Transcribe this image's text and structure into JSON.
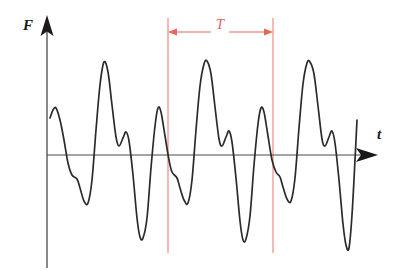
{
  "figure": {
    "background_color": "#ffffff",
    "width": 401,
    "height": 271
  },
  "axes": {
    "vertical": {
      "label": "F",
      "icon": "up-arrow-icon",
      "color": "#333333",
      "x": 47,
      "top_y": 18,
      "bottom_y": 268,
      "label_x": 23,
      "label_y": 30
    },
    "horizontal": {
      "label": "t",
      "icon": "right-arrow-icon",
      "color": "#333333",
      "y": 155,
      "left_x": 47,
      "right_x": 376,
      "label_x": 377,
      "label_y": 139
    }
  },
  "period_marker": {
    "label": "T",
    "color": "#e8665a",
    "left_line_x": 168,
    "right_line_x": 273,
    "line_top_y": 18,
    "line_bottom_y": 253,
    "arrow_y": 32,
    "label_x": 220,
    "label_y": 29
  },
  "chart_data": {
    "type": "line",
    "title": "",
    "xlabel": "t",
    "ylabel": "F",
    "grid": false,
    "legend": null,
    "series_color": "#2b2b2b",
    "baseline_value": 0,
    "period_T_px": 105,
    "annotations": [
      {
        "text": "T",
        "color": "#e8665a",
        "kind": "period-span",
        "from_x": 168,
        "to_x": 273
      }
    ],
    "points": [
      [
        50,
        118
      ],
      [
        53,
        110
      ],
      [
        56,
        108
      ],
      [
        60,
        120
      ],
      [
        64,
        140
      ],
      [
        68,
        163
      ],
      [
        72,
        175
      ],
      [
        77,
        179
      ],
      [
        80,
        188
      ],
      [
        84,
        201
      ],
      [
        88,
        203
      ],
      [
        92,
        180
      ],
      [
        96,
        130
      ],
      [
        100,
        85
      ],
      [
        104,
        62
      ],
      [
        108,
        72
      ],
      [
        112,
        105
      ],
      [
        116,
        137
      ],
      [
        119,
        146
      ],
      [
        123,
        138
      ],
      [
        126,
        132
      ],
      [
        129,
        141
      ],
      [
        133,
        175
      ],
      [
        137,
        218
      ],
      [
        140,
        237
      ],
      [
        143,
        238
      ],
      [
        147,
        218
      ],
      [
        151,
        168
      ],
      [
        155,
        126
      ],
      [
        158,
        108
      ],
      [
        161,
        112
      ],
      [
        165,
        136
      ],
      [
        169,
        160
      ],
      [
        172,
        172
      ],
      [
        177,
        178
      ],
      [
        180,
        188
      ],
      [
        184,
        200
      ],
      [
        188,
        203
      ],
      [
        192,
        180
      ],
      [
        196,
        130
      ],
      [
        200,
        86
      ],
      [
        204,
        64
      ],
      [
        207,
        61
      ],
      [
        211,
        74
      ],
      [
        215,
        107
      ],
      [
        219,
        139
      ],
      [
        222,
        146
      ],
      [
        226,
        137
      ],
      [
        229,
        131
      ],
      [
        232,
        142
      ],
      [
        236,
        178
      ],
      [
        240,
        221
      ],
      [
        243,
        240
      ],
      [
        246,
        239
      ],
      [
        250,
        216
      ],
      [
        254,
        165
      ],
      [
        258,
        124
      ],
      [
        261,
        108
      ],
      [
        264,
        112
      ],
      [
        268,
        136
      ],
      [
        272,
        160
      ],
      [
        276,
        172
      ],
      [
        280,
        177
      ],
      [
        283,
        187
      ],
      [
        287,
        199
      ],
      [
        291,
        201
      ],
      [
        295,
        178
      ],
      [
        299,
        128
      ],
      [
        303,
        84
      ],
      [
        307,
        63
      ],
      [
        310,
        62
      ],
      [
        314,
        74
      ],
      [
        318,
        106
      ],
      [
        322,
        139
      ],
      [
        325,
        146
      ],
      [
        329,
        137
      ],
      [
        332,
        131
      ],
      [
        335,
        143
      ],
      [
        339,
        180
      ],
      [
        343,
        224
      ],
      [
        346,
        245
      ],
      [
        349,
        248
      ],
      [
        352,
        215
      ],
      [
        355,
        160
      ],
      [
        357,
        120
      ]
    ]
  }
}
